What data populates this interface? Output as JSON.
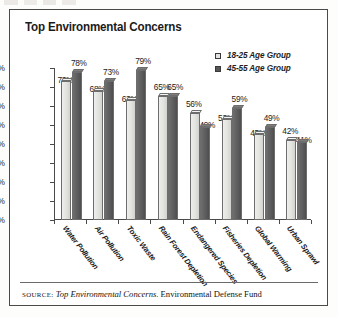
{
  "title": "Top Environmental Concerns",
  "legend": {
    "items": [
      {
        "label": "18-25 Age Group",
        "swatch": "light-square-icon"
      },
      {
        "label": "45-55 Age Group",
        "swatch": "dark-square-icon"
      }
    ]
  },
  "source": {
    "prefix": "SOURCE:",
    "work": " Top Environmental Concerns",
    "publisher": ". Environmental Defense Fund"
  },
  "axis": {
    "y_ticks": [
      "0%",
      "10%",
      "20%",
      "30%",
      "40%",
      "50%",
      "60%",
      "70%",
      "80%"
    ]
  },
  "colors": {
    "series_18_25": "#e3e3e1",
    "series_45_55": "#565656",
    "frame": "#4a4a48",
    "text": "#1a1a1a",
    "background": "#ffffff"
  },
  "chart_data": {
    "type": "bar",
    "title": "Top Environmental Concerns",
    "xlabel": "",
    "ylabel": "",
    "ylim": [
      0,
      80
    ],
    "ytick_step": 10,
    "grid": false,
    "legend_position": "top-right",
    "value_suffix": "%",
    "categories": [
      "Water Pollution",
      "Air Pollution",
      "Toxic Waste",
      "Rain Forest Depletion",
      "Endangered Species",
      "Fisheries Depletion",
      "Global Warming",
      "Urban Sprawl"
    ],
    "series": [
      {
        "name": "18-25 Age Group",
        "values": [
          73,
          68,
          63,
          65,
          56,
          53,
          45,
          42
        ]
      },
      {
        "name": "45-55 Age Group",
        "values": [
          78,
          73,
          79,
          65,
          49,
          59,
          49,
          41
        ]
      }
    ],
    "labels": {
      "series_0": [
        "73%",
        "68%",
        "63%",
        "65%",
        "56%",
        "53%",
        "45%",
        "42%"
      ],
      "series_1": [
        "78%",
        "73%",
        "79%",
        "65%",
        "49%",
        "59%",
        "49%",
        "41%"
      ]
    }
  }
}
